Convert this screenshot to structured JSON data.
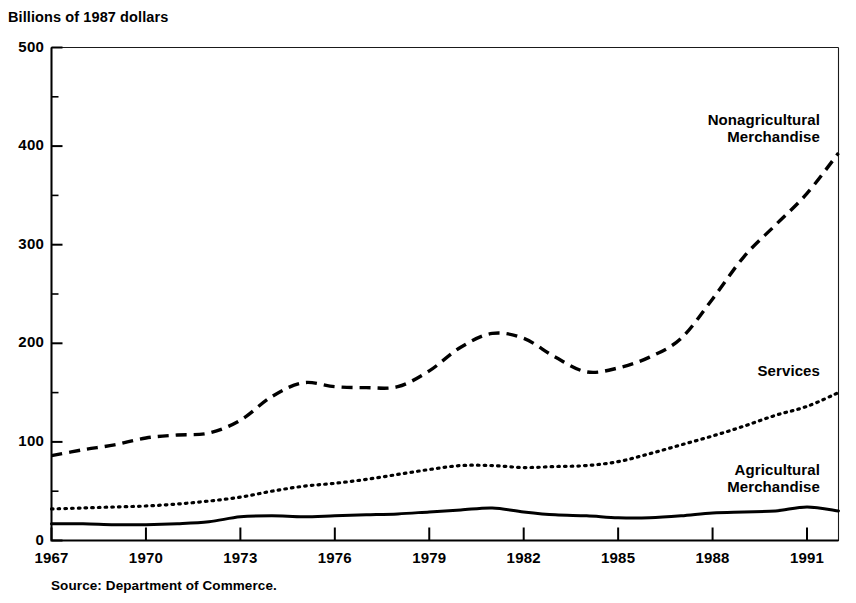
{
  "chart_data": {
    "type": "line",
    "title": "",
    "ylabel": "Billions of 1987 dollars",
    "xlabel": "",
    "ylim": [
      0,
      500
    ],
    "xlim": [
      1967,
      1992
    ],
    "grid": false,
    "legend_position": "inline-right",
    "source": "Source: Department of Commerce.",
    "y_ticks": [
      "0",
      "100",
      "200",
      "300",
      "400",
      "500"
    ],
    "y_tick_values": [
      0,
      100,
      200,
      300,
      400,
      500
    ],
    "y_minor_tick_values": [
      50,
      150,
      250,
      350,
      450
    ],
    "x_ticks": [
      "1967",
      "1970",
      "1973",
      "1976",
      "1979",
      "1982",
      "1985",
      "1988",
      "1991"
    ],
    "x_tick_values": [
      1967,
      1970,
      1973,
      1976,
      1979,
      1982,
      1985,
      1988,
      1991
    ],
    "x": [
      1967,
      1968,
      1969,
      1970,
      1971,
      1972,
      1973,
      1974,
      1975,
      1976,
      1977,
      1978,
      1979,
      1980,
      1981,
      1982,
      1983,
      1984,
      1985,
      1986,
      1987,
      1988,
      1989,
      1990,
      1991,
      1992
    ],
    "series": [
      {
        "name": "Nonagricultural Merchandise",
        "style": "dashed",
        "label_line1": "Nonagricultural",
        "label_line2": "Merchandise",
        "values": [
          86,
          92,
          97,
          104,
          107,
          109,
          122,
          146,
          160,
          156,
          155,
          156,
          172,
          196,
          210,
          205,
          186,
          171,
          175,
          186,
          205,
          245,
          288,
          320,
          352,
          393
        ]
      },
      {
        "name": "Services",
        "style": "dotted",
        "label_line1": "Services",
        "label_line2": "",
        "values": [
          32,
          33,
          34,
          35,
          37,
          40,
          44,
          50,
          55,
          58,
          62,
          67,
          72,
          76,
          76,
          74,
          75,
          76,
          80,
          88,
          97,
          106,
          116,
          127,
          136,
          150
        ]
      },
      {
        "name": "Agricultural Merchandise",
        "style": "solid",
        "label_line1": "Agricultural",
        "label_line2": "Merchandise",
        "values": [
          17,
          17,
          16,
          16,
          17,
          19,
          24,
          25,
          24,
          25,
          26,
          27,
          29,
          31,
          33,
          29,
          26,
          25,
          23,
          23,
          25,
          28,
          29,
          30,
          34,
          30
        ]
      }
    ]
  },
  "colors": {
    "ink": "#000000",
    "background": "#ffffff"
  }
}
